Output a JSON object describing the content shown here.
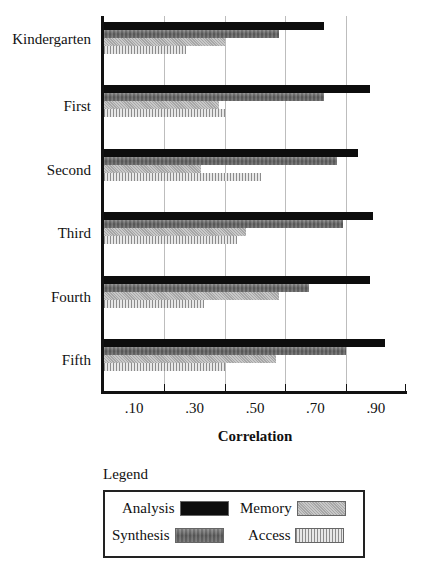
{
  "chart_data": {
    "type": "bar",
    "orientation": "horizontal",
    "title": "",
    "xlabel": "Correlation",
    "ylabel": "",
    "xlim": [
      0,
      1.0
    ],
    "x_tick_labels": [
      ".10",
      ".30",
      ".50",
      ".70",
      ".90"
    ],
    "grid": true,
    "legend_position": "bottom",
    "categories": [
      "Kindergarten",
      "First",
      "Second",
      "Third",
      "Fourth",
      "Fifth"
    ],
    "series": [
      {
        "name": "Analysis",
        "values": [
          0.73,
          0.88,
          0.84,
          0.89,
          0.88,
          0.93
        ]
      },
      {
        "name": "Synthesis",
        "values": [
          0.58,
          0.73,
          0.77,
          0.79,
          0.68,
          0.8
        ]
      },
      {
        "name": "Memory",
        "values": [
          0.4,
          0.38,
          0.32,
          0.47,
          0.58,
          0.57
        ]
      },
      {
        "name": "Access",
        "values": [
          0.27,
          0.4,
          0.52,
          0.44,
          0.33,
          0.4
        ]
      }
    ]
  },
  "legend": {
    "title": "Legend",
    "items": [
      {
        "label": "Analysis",
        "pattern": "solid-black"
      },
      {
        "label": "Memory",
        "pattern": "light-gray-stipple"
      },
      {
        "label": "Synthesis",
        "pattern": "dark-gray-mottled"
      },
      {
        "label": "Access",
        "pattern": "vertical-lines"
      }
    ]
  }
}
